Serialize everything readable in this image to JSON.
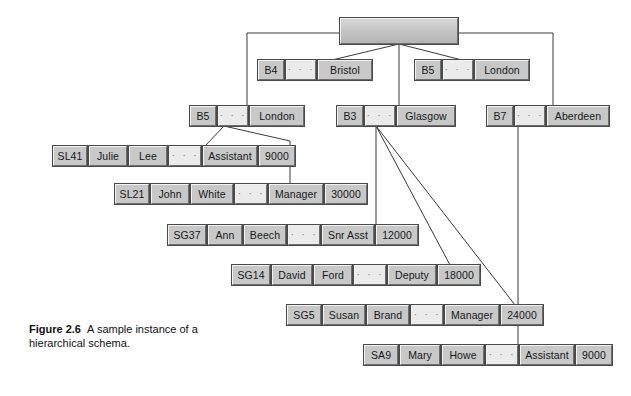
{
  "figure": {
    "caption_label": "Figure 2.6",
    "caption_text": "A sample instance of a hierarchical schema.",
    "ellipsis": "· · ·",
    "colors": {
      "cell_face": "#c8c8c8",
      "cell_light": "#f2f2f2",
      "cell_shadow": "#6e6e6e",
      "cell_outline": "#4a4a4a",
      "ellipsis_face": "#ebebeb",
      "line": "#3a3a3a",
      "background": "#ffffff"
    }
  },
  "nodes": {
    "root": {
      "label": "",
      "x": 340,
      "y": 18,
      "width": 118,
      "height": 26
    },
    "branches": [
      {
        "id": "b4",
        "code": "B4",
        "city": "Bristol",
        "x": 258,
        "y": 60,
        "w_code": 26,
        "w_ell": 30,
        "w_city": 54
      },
      {
        "id": "b5a",
        "code": "B5",
        "city": "London",
        "x": 415,
        "y": 60,
        "w_code": 26,
        "w_ell": 30,
        "w_city": 54
      },
      {
        "id": "b5b",
        "code": "B5",
        "city": "London",
        "x": 190,
        "y": 106,
        "w_code": 26,
        "w_ell": 30,
        "w_city": 54
      },
      {
        "id": "b3",
        "code": "B3",
        "city": "Glasgow",
        "x": 337,
        "y": 106,
        "w_code": 26,
        "w_ell": 30,
        "w_city": 58
      },
      {
        "id": "b7",
        "code": "B7",
        "city": "Aberdeen",
        "x": 487,
        "y": 106,
        "w_code": 26,
        "w_ell": 30,
        "w_city": 62
      }
    ],
    "staff": [
      {
        "id": "sl41",
        "x": 53,
        "y": 146,
        "cells": [
          {
            "text": "SL41",
            "w": 34
          },
          {
            "text": "Julie",
            "w": 38
          },
          {
            "text": "Lee",
            "w": 38
          },
          {
            "text": "ellipsis",
            "w": 32
          },
          {
            "text": "Assistant",
            "w": 54
          },
          {
            "text": "9000",
            "w": 36
          }
        ]
      },
      {
        "id": "sl21",
        "x": 115,
        "y": 184,
        "cells": [
          {
            "text": "SL21",
            "w": 34
          },
          {
            "text": "John",
            "w": 38
          },
          {
            "text": "White",
            "w": 42
          },
          {
            "text": "ellipsis",
            "w": 32
          },
          {
            "text": "Manager",
            "w": 54
          },
          {
            "text": "30000",
            "w": 42
          }
        ]
      },
      {
        "id": "sg37",
        "x": 168,
        "y": 225,
        "cells": [
          {
            "text": "SG37",
            "w": 38
          },
          {
            "text": "Ann",
            "w": 34
          },
          {
            "text": "Beech",
            "w": 42
          },
          {
            "text": "ellipsis",
            "w": 32
          },
          {
            "text": "Snr Asst",
            "w": 52
          },
          {
            "text": "12000",
            "w": 42
          }
        ]
      },
      {
        "id": "sg14",
        "x": 232,
        "y": 265,
        "cells": [
          {
            "text": "SG14",
            "w": 38
          },
          {
            "text": "David",
            "w": 40
          },
          {
            "text": "Ford",
            "w": 38
          },
          {
            "text": "ellipsis",
            "w": 32
          },
          {
            "text": "Deputy",
            "w": 48
          },
          {
            "text": "18000",
            "w": 42
          }
        ]
      },
      {
        "id": "sg5",
        "x": 287,
        "y": 305,
        "cells": [
          {
            "text": "SG5",
            "w": 34
          },
          {
            "text": "Susan",
            "w": 42
          },
          {
            "text": "Brand",
            "w": 42
          },
          {
            "text": "ellipsis",
            "w": 32
          },
          {
            "text": "Manager",
            "w": 54
          },
          {
            "text": "24000",
            "w": 42
          }
        ]
      },
      {
        "id": "sa9",
        "x": 364,
        "y": 345,
        "cells": [
          {
            "text": "SA9",
            "w": 34
          },
          {
            "text": "Mary",
            "w": 40
          },
          {
            "text": "Howe",
            "w": 42
          },
          {
            "text": "ellipsis",
            "w": 32
          },
          {
            "text": "Assistant",
            "w": 54
          },
          {
            "text": "9000",
            "w": 36
          }
        ]
      }
    ]
  },
  "connections": [
    {
      "from": "root-left",
      "to": "b5b-top",
      "type": "orthogonal"
    },
    {
      "from": "root-right",
      "to": "b7-top",
      "type": "orthogonal"
    },
    {
      "from": "root-bottom",
      "to": "b4-top",
      "type": "diagonal"
    },
    {
      "from": "root-bottom",
      "to": "b3-top",
      "type": "diagonal"
    },
    {
      "from": "root-bottom",
      "to": "b5a-top",
      "type": "diagonal"
    },
    {
      "from": "b5b-bottom",
      "to": "sl41-top",
      "type": "diagonal"
    },
    {
      "from": "b5b-bottom",
      "to": "sl21-right",
      "type": "orthogonal"
    },
    {
      "from": "b3-bottom",
      "to": "sg37-top",
      "type": "vertical"
    },
    {
      "from": "b3-bottom",
      "to": "sg14-top",
      "type": "diagonal"
    },
    {
      "from": "b3-bottom",
      "to": "sg5-top",
      "type": "diagonal"
    },
    {
      "from": "b7-bottom",
      "to": "sa9-top",
      "type": "vertical"
    }
  ]
}
